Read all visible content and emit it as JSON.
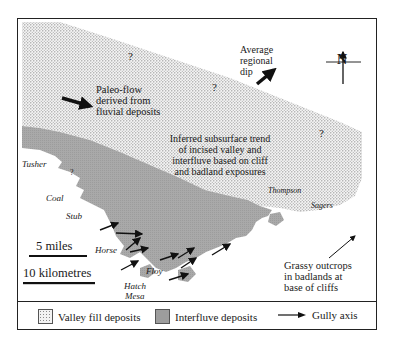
{
  "map": {
    "annotations": {
      "paleoflow": [
        "Paleo-flow",
        "derived from",
        "fluvial deposits"
      ],
      "regional_dip": [
        "Average",
        "regional",
        "dip"
      ],
      "subsurface_trend": [
        "Inferred subsurface trend",
        "of incised valley and",
        "interfluve based on cliff",
        "and badland exposures"
      ],
      "grassy_outcrops": [
        "Grassy outcrops",
        "in badlands at",
        "base of cliffs"
      ],
      "uncertain_marks": [
        "?",
        "?",
        "?",
        "?"
      ]
    },
    "north_arrow": {
      "label": "N"
    },
    "place_names": {
      "tusher": "Tusher",
      "coal": "Coal",
      "sub": "Stub",
      "horse": "Horse",
      "floy": "Floy",
      "hatch": "Hatch",
      "mesa": "Mesa",
      "thompson": "Thompson",
      "sagers": "Sagers"
    },
    "scale": {
      "miles": "5 miles",
      "km": "10 kilometres"
    }
  },
  "legend": {
    "items": [
      {
        "label": "Valley fill deposits",
        "icon": "stipple-swatch"
      },
      {
        "label": "Interfluve deposits",
        "icon": "gray-swatch"
      },
      {
        "label": "Gully axis",
        "icon": "arrow-right"
      }
    ]
  },
  "colors": {
    "interfluve": "#a8a8a8",
    "valley_fill_bg": "#f2f2f2",
    "valley_fill_dot": "#7a7a7a",
    "ink": "#1a1a1a"
  }
}
